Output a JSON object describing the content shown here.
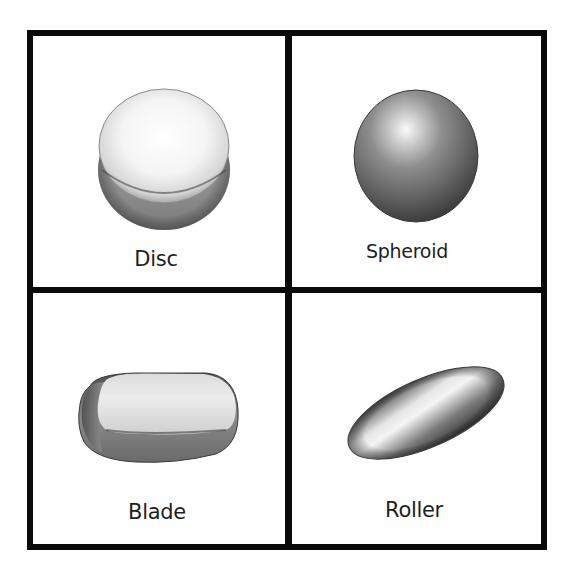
{
  "figure": {
    "layout": "2x2 grid",
    "border_color": "#0a0a0a",
    "background": "#ffffff",
    "panels": [
      {
        "id": "disc",
        "label": "Disc",
        "position": "top-left",
        "shape": "flattened disc (short cylinder with rounded edges)"
      },
      {
        "id": "spheroid",
        "label": "Spheroid",
        "position": "top-right",
        "shape": "sphere"
      },
      {
        "id": "blade",
        "label": "Blade",
        "position": "bottom-left",
        "shape": "flattened rounded slab"
      },
      {
        "id": "roller",
        "label": "Roller",
        "position": "bottom-right",
        "shape": "elongated ellipsoid (cylinder with rounded ends)"
      }
    ]
  }
}
